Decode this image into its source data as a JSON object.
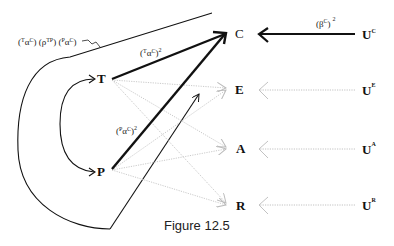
{
  "diagram": {
    "caption": "Figure 12.5",
    "nodes": {
      "T": "T",
      "P": "P",
      "C": "C",
      "E": "E",
      "A": "A",
      "R": "R",
      "UC": {
        "base": "U",
        "sup": "C"
      },
      "UE": {
        "base": "U",
        "sup": "E"
      },
      "UA": {
        "base": "U",
        "sup": "A"
      },
      "UR": {
        "base": "U",
        "sup": "R"
      }
    },
    "labels": {
      "loop_path": {
        "part1_pre": "(",
        "part1_sup": "T",
        "part1_base": "α",
        "part1_sup2": "C",
        "part1_post": ")",
        "part2_pre": "(",
        "part2_base": "ρ",
        "part2_sup": "TP",
        "part2_post": ")",
        "part3_pre": "(",
        "part3_sup": "P",
        "part3_base": "α",
        "part3_sup2": "C",
        "part3_post": ")"
      },
      "t_to_c": {
        "pre": "(",
        "sup": "T",
        "base": "α",
        "sup2": "C",
        "post": ")",
        "exp": "2"
      },
      "p_to_c": {
        "pre": "(",
        "sup": "P",
        "base": "α",
        "sup2": "C",
        "post": ")",
        "exp": "2"
      },
      "u_to_c": {
        "pre": "(",
        "base": "β",
        "sup": "C",
        "post": ")",
        "exp": "2"
      }
    },
    "edges": [
      {
        "from": "T",
        "to": "C",
        "style": "thick"
      },
      {
        "from": "P",
        "to": "C",
        "style": "thick"
      },
      {
        "from": "T",
        "to": "E",
        "style": "dotted"
      },
      {
        "from": "T",
        "to": "A",
        "style": "dotted"
      },
      {
        "from": "T",
        "to": "R",
        "style": "dotted"
      },
      {
        "from": "P",
        "to": "E",
        "style": "dotted"
      },
      {
        "from": "P",
        "to": "A",
        "style": "dotted"
      },
      {
        "from": "P",
        "to": "R",
        "style": "dotted"
      },
      {
        "from": "T",
        "to": "P",
        "style": "curved-double"
      },
      {
        "from": "UC",
        "to": "C",
        "style": "thick"
      },
      {
        "from": "UE",
        "to": "E",
        "style": "dotted"
      },
      {
        "from": "UA",
        "to": "A",
        "style": "dotted"
      },
      {
        "from": "UR",
        "to": "R",
        "style": "dotted"
      },
      {
        "from": "loop",
        "to": "C",
        "style": "thin"
      }
    ]
  }
}
